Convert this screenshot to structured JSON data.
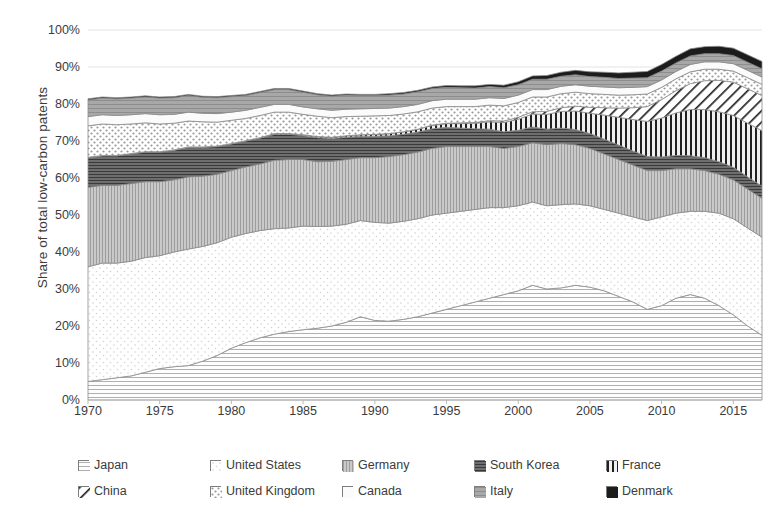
{
  "axes": {
    "ylabel": "Share of total low-carbon patents",
    "yticks": [
      "100%",
      "90%",
      "80%",
      "70%",
      "60%",
      "50%",
      "40%",
      "30%",
      "20%",
      "10%",
      "0%"
    ],
    "xticks": [
      "1970",
      "1975",
      "1980",
      "1985",
      "1990",
      "1995",
      "2000",
      "2005",
      "2010",
      "2015"
    ]
  },
  "legend": {
    "items": [
      {
        "label": "Japan",
        "pattern": "dotted-light",
        "color": "#d9d9d9"
      },
      {
        "label": "United States",
        "pattern": "empty-white",
        "color": "#ffffff"
      },
      {
        "label": "Germany",
        "pattern": "solid-gray",
        "color": "#a6a6a6"
      },
      {
        "label": "South Korea",
        "pattern": "vertical-stripes",
        "color": "#3f3f3f"
      },
      {
        "label": "France",
        "pattern": "dark-horizontal",
        "color": "#595959"
      },
      {
        "label": "China",
        "pattern": "diagonal-hatch",
        "color": "#404040"
      },
      {
        "label": "United Kingdom",
        "pattern": "cross-dots",
        "color": "#cfcfcf"
      },
      {
        "label": "Canada",
        "pattern": "very-light",
        "color": "#f2f2f2"
      },
      {
        "label": "Italy",
        "pattern": "gray-grid",
        "color": "#bfbfbf"
      },
      {
        "label": "Denmark",
        "pattern": "solid-black",
        "color": "#1a1a1a"
      }
    ]
  },
  "chart_data": {
    "type": "area",
    "title": "",
    "xlabel": "",
    "ylabel": "Share of total low-carbon patents",
    "ylim": [
      0,
      100
    ],
    "xlim": [
      1970,
      2017
    ],
    "stacked": true,
    "grid": true,
    "legend_position": "bottom",
    "x": [
      1970,
      1971,
      1972,
      1973,
      1974,
      1975,
      1976,
      1977,
      1978,
      1979,
      1980,
      1981,
      1982,
      1983,
      1984,
      1985,
      1986,
      1987,
      1988,
      1989,
      1990,
      1991,
      1992,
      1993,
      1994,
      1995,
      1996,
      1997,
      1998,
      1999,
      2000,
      2001,
      2002,
      2003,
      2004,
      2005,
      2006,
      2007,
      2008,
      2009,
      2010,
      2011,
      2012,
      2013,
      2014,
      2015,
      2016,
      2017
    ],
    "series": [
      {
        "name": "Japan",
        "values": [
          5.0,
          5.5,
          6.0,
          6.5,
          7.5,
          8.5,
          9.0,
          9.3,
          10.5,
          12.0,
          14.0,
          15.5,
          16.8,
          17.8,
          18.5,
          19.0,
          19.4,
          20.0,
          21.0,
          22.5,
          21.5,
          21.3,
          21.8,
          22.5,
          23.5,
          24.5,
          25.5,
          26.5,
          27.5,
          28.5,
          29.5,
          31.0,
          30.0,
          30.3,
          31.0,
          30.5,
          29.5,
          28.0,
          26.5,
          24.5,
          25.5,
          27.5,
          28.5,
          27.5,
          25.5,
          23.0,
          20.0,
          17.5
        ]
      },
      {
        "name": "United States",
        "values": [
          31.0,
          31.5,
          31.0,
          31.0,
          31.0,
          30.5,
          31.0,
          31.5,
          31.0,
          30.5,
          30.0,
          29.5,
          29.0,
          28.5,
          28.0,
          28.0,
          27.5,
          27.0,
          26.5,
          26.0,
          26.5,
          26.5,
          26.5,
          26.5,
          26.5,
          26.0,
          25.5,
          25.0,
          24.5,
          23.5,
          23.0,
          22.5,
          22.5,
          22.5,
          22.0,
          22.0,
          22.0,
          22.5,
          23.0,
          24.0,
          24.0,
          23.0,
          22.5,
          23.5,
          25.0,
          26.0,
          26.5,
          26.5
        ]
      },
      {
        "name": "Germany",
        "values": [
          21.5,
          21.0,
          21.0,
          21.0,
          20.5,
          20.0,
          19.5,
          19.5,
          19.0,
          18.5,
          18.0,
          18.0,
          18.0,
          18.5,
          18.5,
          18.0,
          17.5,
          17.5,
          17.5,
          17.0,
          17.5,
          18.0,
          18.0,
          18.0,
          18.0,
          18.0,
          17.5,
          17.0,
          16.5,
          16.0,
          16.0,
          16.0,
          16.5,
          16.5,
          16.0,
          15.5,
          15.0,
          14.5,
          14.0,
          13.5,
          12.5,
          12.0,
          11.5,
          11.0,
          10.5,
          10.5,
          10.5,
          10.5
        ]
      },
      {
        "name": "France",
        "values": [
          8.0,
          8.0,
          8.0,
          8.0,
          8.0,
          8.0,
          8.0,
          8.0,
          7.8,
          7.5,
          7.2,
          7.0,
          7.0,
          7.0,
          6.8,
          6.5,
          6.5,
          6.2,
          6.0,
          5.8,
          5.8,
          5.6,
          5.5,
          5.4,
          5.3,
          5.2,
          5.0,
          4.8,
          4.7,
          4.5,
          4.4,
          4.3,
          4.2,
          4.2,
          4.1,
          4.0,
          4.0,
          3.9,
          3.8,
          3.8,
          3.7,
          3.6,
          3.5,
          3.5,
          3.4,
          3.4,
          3.3,
          3.3
        ]
      },
      {
        "name": "South Korea",
        "values": [
          0.1,
          0.1,
          0.1,
          0.1,
          0.1,
          0.1,
          0.1,
          0.1,
          0.1,
          0.1,
          0.1,
          0.1,
          0.1,
          0.2,
          0.2,
          0.2,
          0.3,
          0.3,
          0.4,
          0.4,
          0.5,
          0.6,
          0.7,
          0.8,
          0.9,
          1.0,
          1.2,
          1.5,
          2.0,
          2.5,
          3.0,
          3.5,
          4.0,
          4.5,
          5.0,
          5.5,
          6.5,
          7.5,
          8.5,
          9.5,
          10.5,
          11.5,
          12.5,
          13.0,
          13.5,
          14.0,
          14.5,
          15.0
        ]
      },
      {
        "name": "China",
        "values": [
          0.0,
          0.0,
          0.0,
          0.0,
          0.0,
          0.0,
          0.0,
          0.0,
          0.0,
          0.0,
          0.0,
          0.0,
          0.0,
          0.0,
          0.0,
          0.0,
          0.0,
          0.0,
          0.0,
          0.0,
          0.0,
          0.0,
          0.0,
          0.0,
          0.1,
          0.1,
          0.2,
          0.2,
          0.3,
          0.4,
          0.5,
          0.6,
          0.8,
          1.0,
          1.3,
          1.6,
          2.0,
          2.5,
          3.2,
          4.0,
          5.0,
          6.0,
          7.0,
          7.8,
          8.5,
          9.0,
          9.3,
          9.5
        ]
      },
      {
        "name": "United Kingdom",
        "values": [
          8.5,
          8.5,
          8.3,
          8.0,
          7.8,
          7.5,
          7.2,
          7.0,
          6.8,
          6.5,
          6.3,
          6.0,
          6.0,
          5.8,
          5.8,
          5.5,
          5.5,
          5.3,
          5.2,
          5.0,
          5.0,
          4.9,
          4.8,
          4.7,
          4.6,
          4.5,
          4.4,
          4.3,
          4.2,
          4.1,
          4.0,
          4.0,
          3.9,
          3.8,
          3.8,
          3.7,
          3.6,
          3.5,
          3.5,
          3.4,
          3.3,
          3.2,
          3.2,
          3.1,
          3.0,
          3.0,
          3.0,
          3.0
        ]
      },
      {
        "name": "Canada",
        "values": [
          2.5,
          2.5,
          2.5,
          2.5,
          2.5,
          2.5,
          2.4,
          2.4,
          2.3,
          2.3,
          2.2,
          2.2,
          2.2,
          2.1,
          2.1,
          2.0,
          2.0,
          2.0,
          2.0,
          2.0,
          2.0,
          2.0,
          2.0,
          2.0,
          2.0,
          2.0,
          2.0,
          2.0,
          2.0,
          2.0,
          2.0,
          2.0,
          2.0,
          2.0,
          2.0,
          2.0,
          2.0,
          2.0,
          2.0,
          2.0,
          2.0,
          2.0,
          2.0,
          2.0,
          2.0,
          2.0,
          2.0,
          2.0
        ]
      },
      {
        "name": "Italy",
        "values": [
          4.5,
          4.5,
          4.5,
          4.5,
          4.5,
          4.5,
          4.5,
          4.5,
          4.3,
          4.3,
          4.2,
          4.0,
          4.0,
          4.0,
          4.0,
          4.0,
          3.8,
          3.8,
          3.8,
          3.6,
          3.5,
          3.5,
          3.4,
          3.4,
          3.3,
          3.2,
          3.1,
          3.0,
          3.0,
          2.9,
          2.8,
          2.8,
          2.8,
          2.7,
          2.7,
          2.6,
          2.6,
          2.5,
          2.5,
          2.4,
          2.4,
          2.3,
          2.3,
          2.2,
          2.2,
          2.2,
          2.2,
          2.2
        ]
      },
      {
        "name": "Denmark",
        "values": [
          0.3,
          0.3,
          0.3,
          0.3,
          0.3,
          0.3,
          0.3,
          0.3,
          0.3,
          0.3,
          0.3,
          0.3,
          0.3,
          0.3,
          0.3,
          0.3,
          0.3,
          0.3,
          0.3,
          0.3,
          0.3,
          0.4,
          0.4,
          0.4,
          0.4,
          0.5,
          0.5,
          0.6,
          0.6,
          0.7,
          0.8,
          0.9,
          1.0,
          1.1,
          1.2,
          1.3,
          1.4,
          1.5,
          1.6,
          1.7,
          1.8,
          1.8,
          1.9,
          1.9,
          2.0,
          2.0,
          2.0,
          2.0
        ]
      }
    ]
  }
}
